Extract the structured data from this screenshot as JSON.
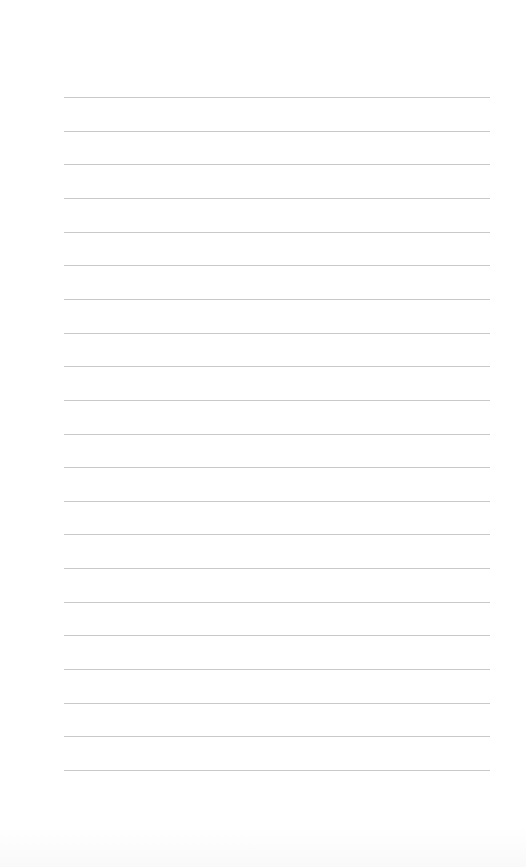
{
  "page": {
    "type": "lined-paper",
    "background_color": "#ffffff",
    "line_color": "#c9c9c9",
    "line_count": 21,
    "line_left_px": 64,
    "line_right_px": 490,
    "first_line_y_px": 97,
    "line_spacing_px": 33.65
  }
}
